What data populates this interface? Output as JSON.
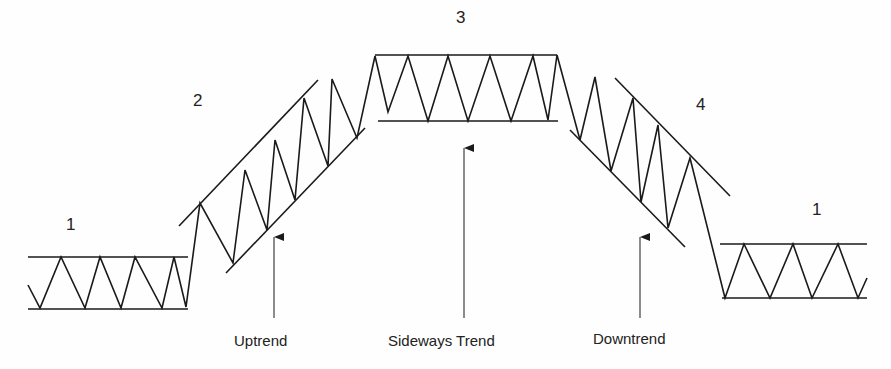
{
  "diagram": {
    "phases": [
      {
        "id": "phase-1-left",
        "number": "1",
        "type": "sideways"
      },
      {
        "id": "phase-2",
        "number": "2",
        "type": "uptrend"
      },
      {
        "id": "phase-3",
        "number": "3",
        "type": "sideways"
      },
      {
        "id": "phase-4",
        "number": "4",
        "type": "downtrend"
      },
      {
        "id": "phase-1-right",
        "number": "1",
        "type": "sideways"
      }
    ],
    "captions": {
      "uptrend": "Uptrend",
      "sideways": "Sideways Trend",
      "downtrend": "Downtrend"
    },
    "colors": {
      "line": "#1a1a1a",
      "background": "#fefefe"
    }
  }
}
